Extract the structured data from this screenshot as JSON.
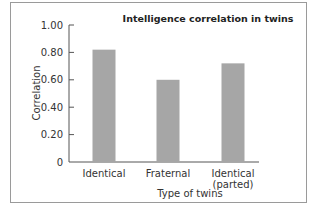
{
  "chart_data": {
    "type": "bar",
    "title": "Intelligence correlation in twins",
    "xlabel": "Type of twins",
    "ylabel": "Correlation",
    "categories": [
      "Identical",
      "Fraternal",
      "Identical (parted)"
    ],
    "category_lines": [
      [
        "Identical"
      ],
      [
        "Fraternal"
      ],
      [
        "Identical",
        "(parted)"
      ]
    ],
    "values": [
      0.82,
      0.6,
      0.72
    ],
    "ylim": [
      0,
      1.0
    ],
    "yticks": [
      0,
      0.2,
      0.4,
      0.6,
      0.8,
      1.0
    ],
    "ytick_labels": [
      "0",
      "0.20",
      "0.40",
      "0.60",
      "0.80",
      "1.00"
    ],
    "grid": false,
    "bar_color": "#a6a6a6",
    "axis_color": "#555555"
  }
}
